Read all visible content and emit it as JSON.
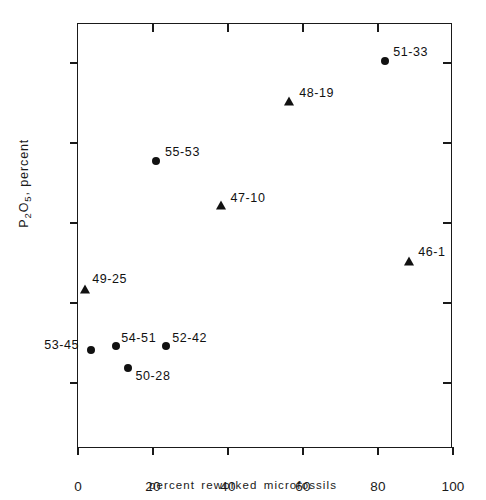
{
  "chart_data": {
    "type": "scatter",
    "title": "",
    "xlabel": "percent reworked microfossils",
    "ylabel": "P2O5, percent",
    "ylabel_parts": {
      "p": "P",
      "sub2": "2",
      "o": "O",
      "sub5": "5",
      "rest": ", percent"
    },
    "xlim": [
      0,
      100
    ],
    "ylim": [
      0,
      1.1
    ],
    "grid": false,
    "legend": "none",
    "xticks": [
      0,
      20,
      40,
      60,
      80,
      100
    ],
    "xtick_labels": [
      "0",
      "20",
      "40",
      "60",
      "80",
      "100"
    ],
    "yticks": [
      0.2,
      0.4,
      0.6,
      0.8,
      1.0
    ],
    "ytick_labels": [
      "0.2",
      "0.4",
      "0.6",
      "0.8",
      "1.0"
    ],
    "points": [
      {
        "label": "51-33",
        "x": 81.9,
        "y": 1.005,
        "marker": "circle",
        "label_dx": 8,
        "label_dy": -16
      },
      {
        "label": "48-19",
        "x": 56.3,
        "y": 0.905,
        "marker": "triangle",
        "label_dx": 10,
        "label_dy": -15
      },
      {
        "label": "55-53",
        "x": 20.8,
        "y": 0.755,
        "marker": "circle",
        "label_dx": 9,
        "label_dy": -16
      },
      {
        "label": "47-10",
        "x": 38.0,
        "y": 0.645,
        "marker": "triangle",
        "label_dx": 10,
        "label_dy": -14
      },
      {
        "label": "46-1",
        "x": 88.3,
        "y": 0.505,
        "marker": "triangle",
        "label_dx": 9,
        "label_dy": -16
      },
      {
        "label": "49-25",
        "x": 1.9,
        "y": 0.435,
        "marker": "triangle",
        "label_dx": 7,
        "label_dy": -17
      },
      {
        "label": "53-45",
        "x": 3.5,
        "y": 0.283,
        "marker": "circle",
        "label_dx": -47,
        "label_dy": -12
      },
      {
        "label": "54-51",
        "x": 10.2,
        "y": 0.293,
        "marker": "circle",
        "label_dx": 5,
        "label_dy": -15
      },
      {
        "label": "52-42",
        "x": 23.5,
        "y": 0.293,
        "marker": "circle",
        "label_dx": 6,
        "label_dy": -15
      },
      {
        "label": "50-28",
        "x": 13.2,
        "y": 0.237,
        "marker": "circle",
        "label_dx": 8,
        "label_dy": 1
      }
    ]
  }
}
